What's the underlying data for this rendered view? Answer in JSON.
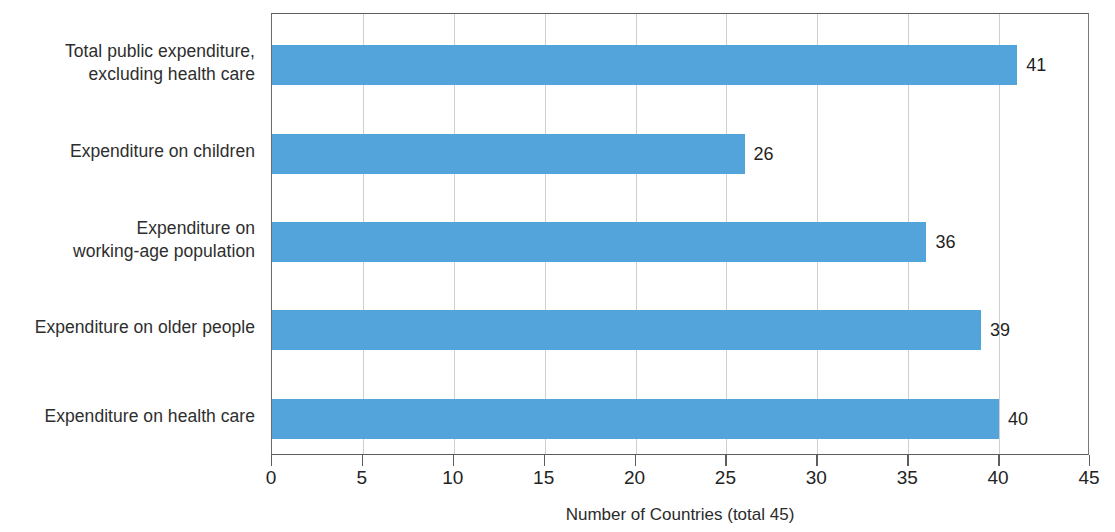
{
  "chart_data": {
    "type": "bar",
    "orientation": "horizontal",
    "title": "",
    "subtitle": "",
    "xlabel": "Number of Countries (total 45)",
    "ylabel": "",
    "categories": [
      "Total public expenditure,\nexcluding health care",
      "Expenditure on children",
      "Expenditure on\nworking-age population",
      "Expenditure on older people",
      "Expenditure on health care"
    ],
    "values": [
      41,
      26,
      36,
      39,
      40
    ],
    "value_labels": [
      "41",
      "26",
      "36",
      "39",
      "40"
    ],
    "xlim": [
      0,
      45
    ],
    "xticks": [
      0,
      5,
      10,
      15,
      20,
      25,
      30,
      35,
      40,
      45
    ],
    "xtick_labels": [
      "0",
      "5",
      "10",
      "15",
      "20",
      "25",
      "30",
      "35",
      "40",
      "45"
    ],
    "grid": true,
    "grid_axis": "x",
    "legend": false,
    "legend_position": "none",
    "bar_color": "#53a4db",
    "grid_color": "#cfcfcf",
    "axis_color": "#5d5d5d",
    "text_color": "#2b2b2b",
    "background": "#ffffff"
  }
}
